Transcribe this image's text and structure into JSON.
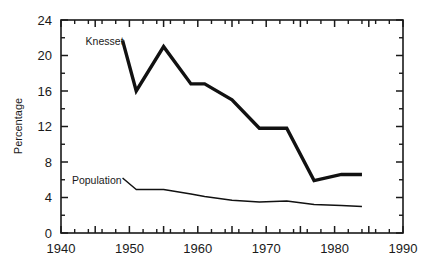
{
  "chart_data": {
    "type": "line",
    "title": "",
    "subtitle": "",
    "xlabel": "",
    "ylabel": "Percentage",
    "xlim": [
      1940,
      1990
    ],
    "ylim": [
      0,
      24
    ],
    "grid": false,
    "legend_position": "inline-annotation",
    "x_ticks_major": [
      1940,
      1945,
      1950,
      1955,
      1960,
      1965,
      1970,
      1975,
      1980,
      1985,
      1990
    ],
    "x_tick_labels": [
      "1940",
      "",
      "1950",
      "",
      "1960",
      "",
      "1970",
      "",
      "1980",
      "",
      "1990"
    ],
    "x_ticks_minor": [
      1942,
      1944,
      1946,
      1948,
      1952,
      1954,
      1956,
      1958,
      1962,
      1964,
      1966,
      1968,
      1972,
      1974,
      1976,
      1978,
      1982,
      1984,
      1986,
      1988
    ],
    "y_ticks_major": [
      0,
      4,
      8,
      12,
      16,
      20,
      24
    ],
    "y_tick_labels": [
      "0",
      "4",
      "8",
      "12",
      "16",
      "20",
      "24"
    ],
    "y_ticks_minor": [
      2,
      6,
      10,
      14,
      18,
      22
    ],
    "series": [
      {
        "name": "Knesset",
        "label": "Knesset",
        "color": "#111111",
        "x": [
          1949,
          1951,
          1955,
          1959,
          1961,
          1965,
          1969,
          1973,
          1977,
          1981,
          1984
        ],
        "values": [
          21.7,
          16.0,
          21.0,
          16.8,
          16.8,
          15.0,
          11.8,
          11.8,
          5.9,
          6.6,
          6.6
        ]
      },
      {
        "name": "Population",
        "label": "Population",
        "color": "#111111",
        "x": [
          1949,
          1951,
          1955,
          1959,
          1961,
          1965,
          1969,
          1973,
          1977,
          1981,
          1984
        ],
        "values": [
          6.2,
          4.9,
          4.9,
          4.4,
          4.1,
          3.7,
          3.5,
          3.6,
          3.2,
          3.1,
          3.0
        ]
      }
    ],
    "annotations": [
      {
        "text": "Knesset",
        "x": 1943.6,
        "y": 21.2
      },
      {
        "text": "Population",
        "x": 1941.6,
        "y": 5.5
      }
    ]
  }
}
